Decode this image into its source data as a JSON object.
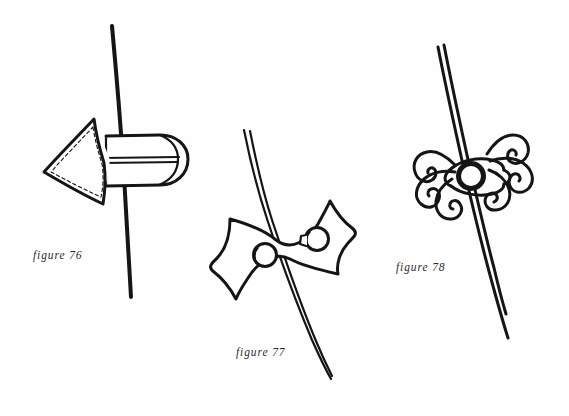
{
  "page": {
    "background_color": "#fefefe",
    "ink_color": "#151515",
    "width": 569,
    "height": 416
  },
  "figures": [
    {
      "id": "figure-76",
      "caption": "figure 76",
      "subject": "triangular-flap-toggle-closure",
      "description": "Pointed triangular flap with dashed topstitching joined to a rounded tab with a horizontal slot, threaded onto a single vertical cord.",
      "cord_style": "single-line",
      "caption_x": 33,
      "caption_y": 249
    },
    {
      "id": "figure-77",
      "caption": "figure 77",
      "subject": "bowtie-button-plate",
      "description": "Waisted bowtie shaped panel with pointed corners carrying two round buttons, the right one with a shank, crossed behind by a double-line cord running from upper left to lower right.",
      "cord_style": "double-line",
      "button_count": 2,
      "caption_x": 236,
      "caption_y": 346
    },
    {
      "id": "figure-78",
      "caption": "figure 78",
      "subject": "ornate-frog-clasp",
      "description": "Decorative frog closure with three-lobed scrolled loops on each side joined by an eye shaped centre holding a round ball button, mounted on a double-line cord.",
      "cord_style": "double-line",
      "loop_count": 6,
      "caption_x": 396,
      "caption_y": 261
    }
  ],
  "captions": {
    "fig76": "figure 76",
    "fig77": "figure 77",
    "fig78": "figure 78"
  }
}
